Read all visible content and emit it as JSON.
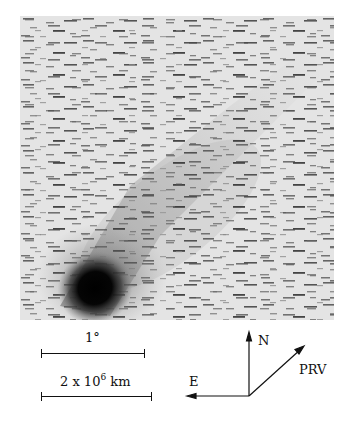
{
  "figure": {
    "scale_bars": [
      {
        "label": "1°"
      },
      {
        "label_main": "2 x 10",
        "label_exp": "6",
        "label_unit": " km"
      }
    ],
    "compass": {
      "north_label": "N",
      "east_label": "E",
      "velocity_label": "PRV"
    }
  }
}
